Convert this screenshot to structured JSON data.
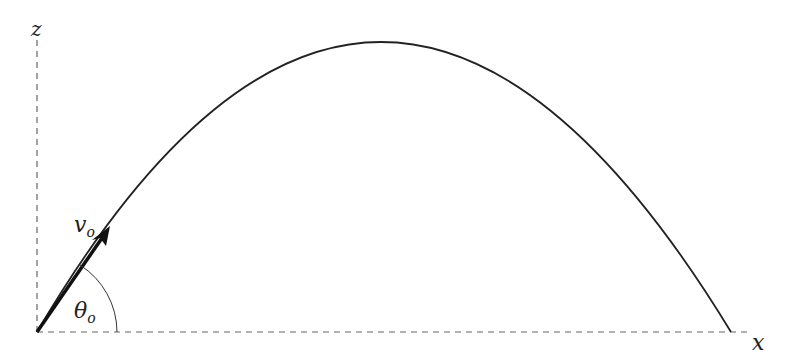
{
  "diagram": {
    "axes": {
      "x_label": "x",
      "z_label": "z"
    },
    "initial_velocity": {
      "symbol": "v",
      "subscript": "o"
    },
    "launch_angle": {
      "symbol": "θ",
      "subscript": "o"
    },
    "colors": {
      "curve": "#222222",
      "axis": "#555555",
      "arrow": "#111111"
    }
  }
}
